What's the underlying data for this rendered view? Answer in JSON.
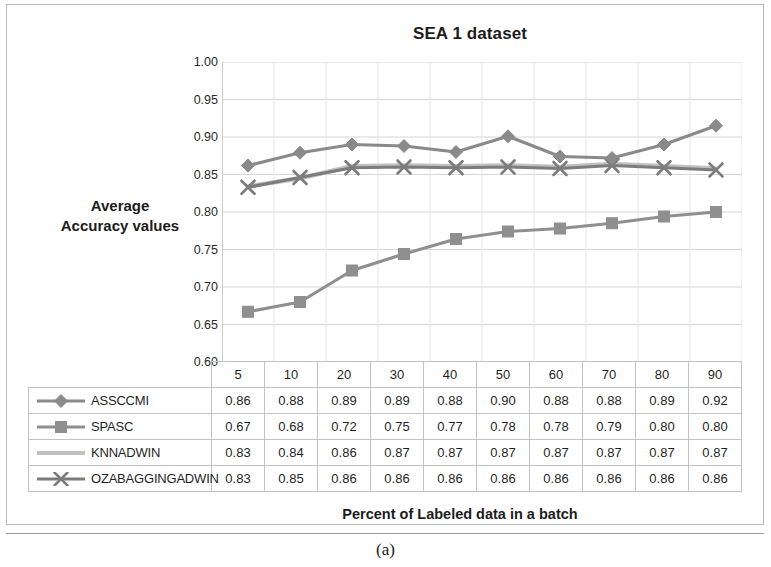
{
  "figure": {
    "caption": "(a)"
  },
  "chart_data": {
    "type": "line",
    "title": "SEA 1 dataset",
    "xlabel": "Percent of Labeled data in a batch",
    "ylabel": "Average Accuracy values",
    "ylabel_lines": [
      "Average",
      "Accuracy values"
    ],
    "categories": [
      "5",
      "10",
      "20",
      "30",
      "40",
      "50",
      "60",
      "70",
      "80",
      "90"
    ],
    "ylim": [
      0.6,
      1.0
    ],
    "ytick_labels": [
      "1.00",
      "0.95",
      "0.90",
      "0.85",
      "0.80",
      "0.75",
      "0.70",
      "0.65",
      "0.60"
    ],
    "yticks": [
      1.0,
      0.95,
      0.9,
      0.85,
      0.8,
      0.75,
      0.7,
      0.65,
      0.6
    ],
    "grid": true,
    "legend_position": "table-left",
    "series": [
      {
        "name": "ASSCCMI",
        "marker": "diamond",
        "color": "#8a8a8a",
        "values": [
          0.86,
          0.88,
          0.89,
          0.89,
          0.88,
          0.9,
          0.88,
          0.88,
          0.89,
          0.92
        ],
        "plot_values": [
          0.862,
          0.879,
          0.89,
          0.888,
          0.88,
          0.901,
          0.874,
          0.872,
          0.89,
          0.915
        ]
      },
      {
        "name": "SPASC",
        "marker": "square",
        "color": "#8f8f8f",
        "values": [
          0.67,
          0.68,
          0.72,
          0.75,
          0.77,
          0.78,
          0.78,
          0.79,
          0.8,
          0.8
        ],
        "plot_values": [
          0.667,
          0.68,
          0.722,
          0.744,
          0.764,
          0.774,
          0.778,
          0.785,
          0.794,
          0.8
        ]
      },
      {
        "name": "KNNADWIN",
        "marker": "line",
        "color": "#c0c0c0",
        "values": [
          0.83,
          0.84,
          0.86,
          0.87,
          0.87,
          0.87,
          0.87,
          0.87,
          0.87,
          0.87
        ],
        "plot_values": [
          0.834,
          0.845,
          0.861,
          0.862,
          0.861,
          0.862,
          0.86,
          0.864,
          0.861,
          0.858
        ]
      },
      {
        "name": "OZABAGGINGADWIN",
        "marker": "x",
        "color": "#7c7c7c",
        "values": [
          0.83,
          0.85,
          0.86,
          0.86,
          0.86,
          0.86,
          0.86,
          0.86,
          0.86,
          0.86
        ],
        "plot_values": [
          0.833,
          0.846,
          0.859,
          0.86,
          0.859,
          0.86,
          0.858,
          0.862,
          0.859,
          0.856
        ]
      }
    ]
  }
}
